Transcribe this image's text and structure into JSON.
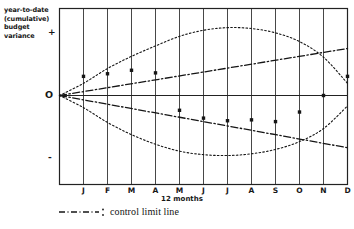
{
  "chart_data": {
    "type": "line",
    "title": "",
    "ylabel": "year-to-date (cumulative) budget variance",
    "xlabel": "12 months",
    "categories": [
      "J",
      "F",
      "M",
      "A",
      "M",
      "J",
      "J",
      "A",
      "S",
      "O",
      "N",
      "D"
    ],
    "x": [
      1,
      2,
      3,
      4,
      5,
      6,
      7,
      8,
      9,
      10,
      11,
      12
    ],
    "y_axis_markers": {
      "positive": "+",
      "zero": "O",
      "negative": "-"
    },
    "ylim": [
      -100,
      100
    ],
    "grid": "vertical gridlines at each month",
    "legend": {
      "position": "below-axis",
      "entries": [
        "control limit line"
      ]
    },
    "series": [
      {
        "name": "upper control envelope",
        "style": "dotted-curve",
        "values": [
          14,
          31,
          45,
          57,
          68,
          75,
          78,
          77,
          72,
          62,
          44,
          14
        ]
      },
      {
        "name": "lower control envelope",
        "style": "dotted-curve",
        "values": [
          -14,
          -31,
          -45,
          -56,
          -64,
          -68,
          -69,
          -67,
          -62,
          -53,
          -38,
          -12
        ]
      },
      {
        "name": "upper control limit line",
        "style": "dash-dot-straight",
        "values": [
          4,
          9,
          13,
          18,
          22,
          27,
          31,
          36,
          40,
          45,
          49,
          54
        ]
      },
      {
        "name": "lower control limit line",
        "style": "dash-dot-straight",
        "values": [
          -5,
          -10,
          -15,
          -20,
          -25,
          -30,
          -35,
          -40,
          -45,
          -50,
          -55,
          -60
        ]
      },
      {
        "name": "actual variance data points",
        "style": "scatter-dots",
        "values": [
          22,
          25,
          29,
          26,
          -17,
          -26,
          -29,
          -28,
          -30,
          -19,
          0,
          22
        ]
      }
    ],
    "annotations": []
  },
  "legend": {
    "control_limit_label": "control limit line",
    "swatch_style": "dash-dot"
  },
  "axes": {
    "y_title": "year-to-date (cumulative) budget variance",
    "y_title_line1": "year-to-date",
    "y_title_line2": "(cumulative)",
    "y_title_line3": "budget variance",
    "plus_sign": "+",
    "origin_label": "O",
    "minus_sign": "-",
    "x_title": "12 months",
    "month_labels": [
      "J",
      "F",
      "M",
      "A",
      "M",
      "J",
      "J",
      "A",
      "S",
      "O",
      "N",
      "D"
    ]
  },
  "colors": {
    "ink": "#161616",
    "frame": "#222222",
    "grid": "#333333"
  }
}
